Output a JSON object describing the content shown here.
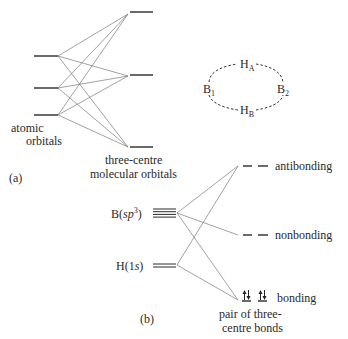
{
  "part_a": {
    "label": "(a)",
    "atomic_orbitals_label_line1": "atomic",
    "atomic_orbitals_label_line2": "orbitals",
    "mo_label_line1": "three-centre",
    "mo_label_line2": "molecular orbitals",
    "atomic_orbital_count": 3,
    "molecular_orbital_count": 3,
    "ring": {
      "atoms": [
        {
          "id": "B1",
          "symbol": "B",
          "subscript": "1"
        },
        {
          "id": "HA",
          "symbol": "H",
          "subscript": "A"
        },
        {
          "id": "B2",
          "symbol": "B",
          "subscript": "2"
        },
        {
          "id": "HB",
          "symbol": "H",
          "subscript": "B"
        }
      ]
    }
  },
  "part_b": {
    "label": "(b)",
    "boron_label": "B(",
    "boron_orbital": "sp",
    "boron_superscript": "3",
    "boron_close": ")",
    "boron_degeneracy": 4,
    "hydrogen_label": "H(1",
    "hydrogen_orbital": "s",
    "hydrogen_close": ")",
    "hydrogen_degeneracy": 2,
    "levels": {
      "antibonding": "antibonding",
      "nonbonding": "nonbonding",
      "bonding": "bonding"
    },
    "bonding_note_line1": "pair of three-",
    "bonding_note_line2": "centre bonds",
    "bonding_electrons": 4
  }
}
